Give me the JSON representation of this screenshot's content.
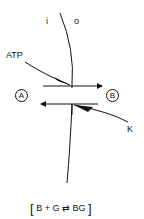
{
  "labels": {
    "inside": "i",
    "outside": "o",
    "atp": "ATP",
    "k": "K",
    "node_a": "A",
    "node_b": "B"
  },
  "equation": {
    "open_bracket": "[",
    "left": "B + G",
    "arrow": "⇄",
    "right": "BG",
    "close_bracket": "]"
  },
  "colors": {
    "stroke": "#111111",
    "background": "#ffffff"
  }
}
